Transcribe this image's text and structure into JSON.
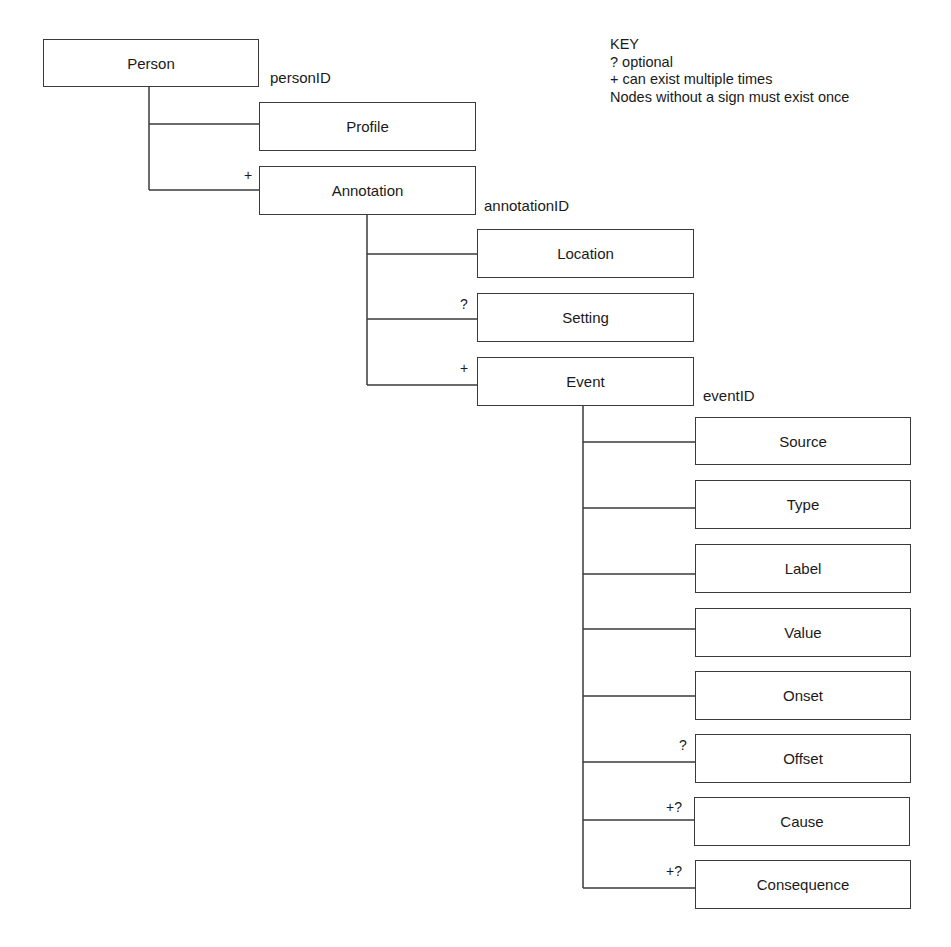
{
  "key": {
    "title": "KEY",
    "lines": [
      "? optional",
      "+ can exist multiple times",
      "Nodes without a sign must exist once"
    ]
  },
  "nodes": {
    "person": {
      "label": "Person",
      "id_label": "personID"
    },
    "profile": {
      "label": "Profile",
      "sign": ""
    },
    "annotation": {
      "label": "Annotation",
      "sign": "+",
      "id_label": "annotationID"
    },
    "location": {
      "label": "Location",
      "sign": ""
    },
    "setting": {
      "label": "Setting",
      "sign": "?"
    },
    "event": {
      "label": "Event",
      "sign": "+",
      "id_label": "eventID"
    },
    "source": {
      "label": "Source",
      "sign": ""
    },
    "type": {
      "label": "Type",
      "sign": ""
    },
    "label": {
      "label": "Label",
      "sign": ""
    },
    "value": {
      "label": "Value",
      "sign": ""
    },
    "onset": {
      "label": "Onset",
      "sign": ""
    },
    "offset": {
      "label": "Offset",
      "sign": "?"
    },
    "cause": {
      "label": "Cause",
      "sign": "+?"
    },
    "consequence": {
      "label": "Consequence",
      "sign": "+?"
    }
  }
}
